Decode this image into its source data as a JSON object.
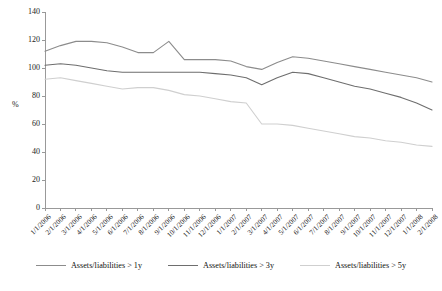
{
  "chart_data": {
    "type": "line",
    "title": "",
    "xlabel": "",
    "ylabel": "%",
    "ylim": [
      0,
      140
    ],
    "ytick_step": 20,
    "yticks": [
      140,
      120,
      100,
      80,
      60,
      40,
      20,
      0
    ],
    "grid": false,
    "legend_position": "bottom",
    "categories": [
      "1/1/2006",
      "2/1/2006",
      "3/1/2006",
      "4/1/2006",
      "5/1/2006",
      "6/1/2006",
      "7/1/2006",
      "8/1/2006",
      "9/1/2006",
      "10/1/2006",
      "11/1/2006",
      "12/1/2006",
      "1/1/2007",
      "2/1/2007",
      "3/1/2007",
      "4/1/2007",
      "5/1/2007",
      "6/1/2007",
      "7/1/2007",
      "8/1/2007",
      "9/1/2007",
      "10/1/2007",
      "11/1/2007",
      "12/1/2007",
      "1/1/2008",
      "2/1/2008"
    ],
    "series": [
      {
        "name": "Assets/liabilities > 1y",
        "color": "#8c8c8c",
        "values": [
          112,
          116,
          119,
          119,
          118,
          115,
          111,
          111,
          119,
          106,
          106,
          106,
          105,
          101,
          99,
          104,
          108,
          107,
          105,
          103,
          101,
          99,
          97,
          95,
          93,
          90
        ]
      },
      {
        "name": "Assets/liabilities > 3y",
        "color": "#6e6e6e",
        "values": [
          102,
          103,
          102,
          100,
          98,
          97,
          97,
          97,
          97,
          97,
          97,
          96,
          95,
          93,
          88,
          93,
          97,
          96,
          93,
          90,
          87,
          85,
          82,
          79,
          75,
          70
        ]
      },
      {
        "name": "Assets/liabilities > 5y",
        "color": "#cfcfcf",
        "values": [
          92,
          93,
          91,
          89,
          87,
          85,
          86,
          86,
          84,
          81,
          80,
          78,
          76,
          75,
          60,
          60,
          59,
          57,
          55,
          53,
          51,
          50,
          48,
          47,
          45,
          44
        ]
      }
    ]
  },
  "legend": {
    "items": [
      {
        "label": "Assets/liabilities > 1y"
      },
      {
        "label": "Assets/liabilities > 3y"
      },
      {
        "label": "Assets/liabilities > 5y"
      }
    ]
  }
}
